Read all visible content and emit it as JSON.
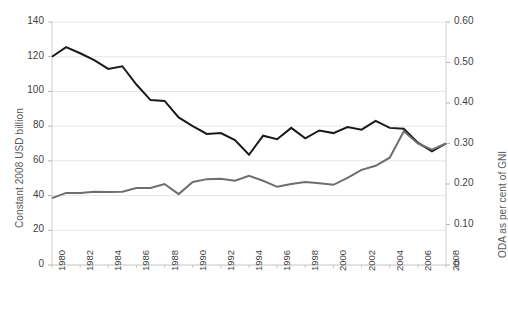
{
  "chart_data": {
    "type": "line",
    "title": "",
    "xlabel": "",
    "ylabel": "Constant 2008 USD billion",
    "y2label": "ODA as per cent of GNI",
    "grid": true,
    "legend": "none",
    "ylim": [
      0,
      140
    ],
    "y2lim": [
      0,
      0.6
    ],
    "yticks": [
      "0",
      "20",
      "40",
      "60",
      "80",
      "100",
      "120",
      "140"
    ],
    "ytick_values": [
      0,
      20,
      40,
      60,
      80,
      100,
      120,
      140
    ],
    "y2ticks": [
      "0",
      "0.10",
      "0.20",
      "0.30",
      "0.40",
      "0.50",
      "0.60"
    ],
    "y2tick_values": [
      0,
      0.1,
      0.2,
      0.3,
      0.4,
      0.5,
      0.6
    ],
    "x": [
      1980,
      1981,
      1982,
      1983,
      1984,
      1985,
      1986,
      1987,
      1988,
      1989,
      1990,
      1991,
      1992,
      1993,
      1994,
      1995,
      1996,
      1997,
      1998,
      1999,
      2000,
      2001,
      2002,
      2003,
      2004,
      2005,
      2006,
      2007,
      2008
    ],
    "xticklabels": [
      "1980",
      "1982",
      "1984",
      "1986",
      "1988",
      "1990",
      "1992",
      "1994",
      "1996",
      "1998",
      "2000",
      "2002",
      "2004",
      "2006",
      "2008"
    ],
    "xtick_values": [
      1980,
      1982,
      1984,
      1986,
      1988,
      1990,
      1992,
      1994,
      1996,
      1998,
      2000,
      2002,
      2004,
      2006,
      2008
    ],
    "series": [
      {
        "name": "Constant 2008 USD billion",
        "axis": "left",
        "color": "#1a1a1a",
        "width": 2.0,
        "values": [
          120.0,
          125.5,
          122.0,
          118.0,
          113.0,
          114.5,
          104.0,
          95.0,
          94.5,
          85.0,
          80.0,
          75.5,
          76.0,
          72.0,
          63.5,
          74.5,
          72.5,
          79.0,
          73.0,
          77.5,
          76.0,
          79.5,
          78.0,
          83.0,
          79.0,
          78.5,
          70.5,
          65.5,
          70.0
        ]
      },
      {
        "name": "ODA as per cent of GNI",
        "axis": "right",
        "color": "#6e6e6e",
        "width": 2.0,
        "values": [
          0.165,
          0.178,
          0.178,
          0.181,
          0.18,
          0.181,
          0.19,
          0.19,
          0.2,
          0.175,
          0.205,
          0.212,
          0.213,
          0.208,
          0.22,
          0.208,
          0.193,
          0.2,
          0.205,
          0.202,
          0.198,
          0.215,
          0.235,
          0.245,
          0.265,
          0.33,
          0.3,
          0.285,
          0.3
        ]
      }
    ]
  },
  "plot": {
    "left": 52,
    "right": 446,
    "top": 22,
    "bottom": 265
  }
}
